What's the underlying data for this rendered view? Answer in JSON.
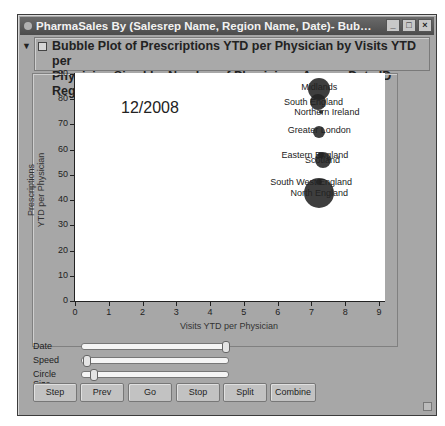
{
  "window": {
    "title": "PharmaSales By (Salesrep Name, Region Name, Date)- Bubble Plot of Prescriptions ...",
    "controls": {
      "minimize": "_",
      "maximize": "□",
      "close": "×"
    }
  },
  "header": {
    "disclosure_icon": "▼",
    "menu_icon": "▾",
    "line1": "Bubble Plot of Prescriptions YTD per Physician by Visits YTD per",
    "line2": "Physician Sized by Number of Physicians Across Date ID Region Name"
  },
  "plot": {
    "date_label": "12/2008"
  },
  "sliders": [
    {
      "label": "Date",
      "position": 1.0
    },
    {
      "label": "Speed",
      "position": 0.0
    },
    {
      "label": "Circle Size",
      "position": 0.06
    }
  ],
  "buttons": [
    {
      "label": "Step"
    },
    {
      "label": "Prev"
    },
    {
      "label": "Go"
    },
    {
      "label": "Stop"
    },
    {
      "label": "Split"
    },
    {
      "label": "Combine"
    }
  ],
  "chart_data": {
    "type": "scatter",
    "subtype": "bubble",
    "title": "Bubble Plot of Prescriptions YTD per Physician by Visits YTD per Physician Sized by Number of Physicians Across Date ID Region Name",
    "frame_label": "12/2008",
    "xlabel": "Visits YTD per Physician",
    "ylabel": "Prescriptions YTD per Physician",
    "xlim": [
      0,
      9
    ],
    "ylim": [
      0,
      90
    ],
    "xticks": [
      0,
      1,
      2,
      3,
      4,
      5,
      6,
      7,
      8,
      9
    ],
    "yticks": [
      0,
      10,
      20,
      30,
      40,
      50,
      60,
      70,
      80,
      90
    ],
    "grid": false,
    "legend": "none",
    "points": [
      {
        "name": "Midlands",
        "x": 7.2,
        "y": 84,
        "size": 22
      },
      {
        "name": "South England",
        "x": 7.15,
        "y": 79,
        "size": 16
      },
      {
        "name": "Northern Ireland",
        "x": 7.25,
        "y": 75,
        "size": 4
      },
      {
        "name": "Greater London",
        "x": 7.2,
        "y": 67,
        "size": 12
      },
      {
        "name": "Eastern England",
        "x": 7.25,
        "y": 58,
        "size": 6
      },
      {
        "name": "Scotland",
        "x": 7.3,
        "y": 56,
        "size": 16
      },
      {
        "name": "South West England",
        "x": 7.2,
        "y": 47,
        "size": 6
      },
      {
        "name": "North England",
        "x": 7.2,
        "y": 43,
        "size": 30
      }
    ]
  }
}
